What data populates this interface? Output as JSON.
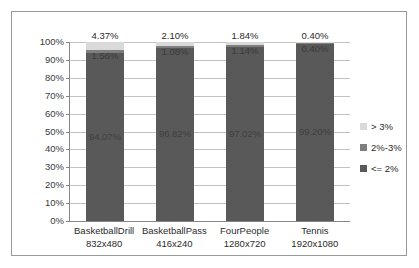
{
  "chart_data": {
    "type": "bar",
    "subtype": "stacked-bar-100-percent",
    "title": "",
    "xlabel": "",
    "ylabel": "",
    "ylim": [
      0,
      100
    ],
    "ytick_labels": [
      "100%",
      "90%",
      "80%",
      "70%",
      "60%",
      "50%",
      "40%",
      "30%",
      "20%",
      "10%",
      "0%"
    ],
    "ytick_values": [
      100,
      90,
      80,
      70,
      60,
      50,
      40,
      30,
      20,
      10,
      0
    ],
    "grid": true,
    "legend_position": "right",
    "categories": [
      {
        "name": "BasketballDrill",
        "resolution": "832x480"
      },
      {
        "name": "BasketballPass",
        "resolution": "416x240"
      },
      {
        "name": "FourPeople",
        "resolution": "1280x720"
      },
      {
        "name": "Tennis",
        "resolution": "1920x1080"
      }
    ],
    "series": [
      {
        "name": "<= 2%",
        "color": "#595959",
        "values": [
          94.07,
          96.82,
          97.02,
          99.2
        ],
        "labels": [
          "94.07%",
          "96.82%",
          "97.02%",
          "99.20%"
        ]
      },
      {
        "name": "2%-3%",
        "color": "#7f7f7f",
        "values": [
          1.56,
          1.08,
          1.14,
          0.4
        ],
        "labels": [
          "1.56%",
          "1.08%",
          "1.14%",
          "0.40%"
        ]
      },
      {
        "name": "> 3%",
        "color": "#d9d9d9",
        "values": [
          4.37,
          2.1,
          1.84,
          0.4
        ],
        "labels": [
          "4.37%",
          "2.10%",
          "1.84%",
          "0.40%"
        ]
      }
    ]
  },
  "legend": {
    "items": [
      {
        "label": "> 3%",
        "color": "#d9d9d9"
      },
      {
        "label": "2%-3%",
        "color": "#7f7f7f"
      },
      {
        "label": "<= 2%",
        "color": "#595959"
      }
    ]
  },
  "colors": {
    "plot_background": "#ffffff",
    "grid": "#c3c3c3",
    "axis": "#868686",
    "frame": "#9a9a9a",
    "text": "#2b2b2b"
  }
}
